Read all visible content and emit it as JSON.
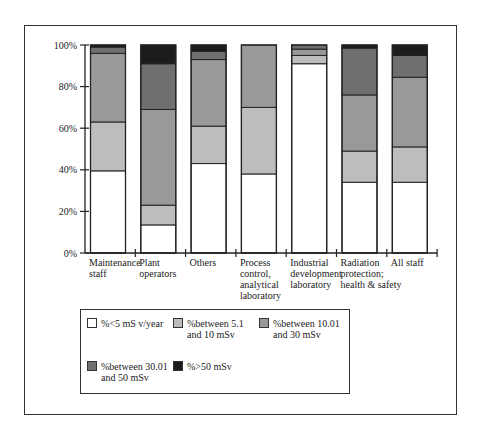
{
  "chart_data": {
    "type": "bar",
    "stacked": true,
    "title": "",
    "xlabel": "",
    "ylabel": "",
    "ylim": [
      0,
      100
    ],
    "yticks": [
      "0%",
      "20%",
      "40%",
      "60%",
      "80%",
      "100%"
    ],
    "categories": [
      "Maintenance staff",
      "Plant operators",
      "Others",
      "Process control, analytical laboratory",
      "Industrial development laboratory",
      "Radiation protection; health & safety",
      "All staff"
    ],
    "category_labels_display": [
      "Maintenance\nstaff",
      "Plant\noperators",
      "Others",
      "Process\ncontrol,\nanalytical\nlaboratory",
      "Industrial\ndevelopment\nlaboratory",
      "Radiation\nprotection;\nhealth & safety",
      "All staff"
    ],
    "series": [
      {
        "name": "%<5 mS v/year",
        "color": "#ffffff",
        "values": [
          39.5,
          13.5,
          43,
          38,
          91,
          34,
          34
        ]
      },
      {
        "name": "%between 5.1 and 10 mSv",
        "color": "#bdbdbd",
        "values": [
          23.5,
          9.5,
          18,
          32,
          4,
          15,
          17
        ]
      },
      {
        "name": "%between 10.01 and 30 mSv",
        "color": "#999999",
        "values": [
          33,
          46,
          32,
          30,
          3,
          27,
          33.5
        ]
      },
      {
        "name": "%between 30.01 and 50 mSv",
        "color": "#6f6f6f",
        "values": [
          3,
          22,
          4,
          0,
          2,
          22.5,
          10.5
        ]
      },
      {
        "name": "%>50 mSv",
        "color": "#1c1c1c",
        "values": [
          1,
          9,
          3,
          0,
          0,
          1.5,
          5
        ]
      }
    ],
    "legend_position": "bottom",
    "grid": false
  },
  "legend": {
    "items": [
      {
        "label": "%<5 mS v/year"
      },
      {
        "label": "%between 5.1\nand 10 mSv"
      },
      {
        "label": "%between 10.01\nand 30 mSv"
      },
      {
        "label": "%between 30.01\nand 50 mSv"
      },
      {
        "label": "%>50 mSv"
      }
    ]
  }
}
